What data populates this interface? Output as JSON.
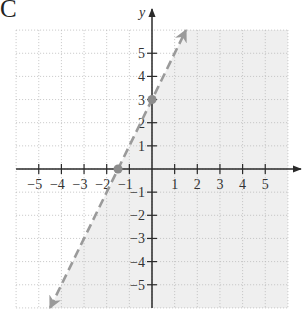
{
  "panel_label": "C",
  "colors": {
    "shading": "#efefef",
    "grid": "#b8b8b8",
    "axis": "#2a2a2a",
    "boundary_line": "#9a9a9a",
    "points": "#8c8c8c",
    "text": "#333333"
  },
  "chart_data": {
    "type": "line",
    "title": "",
    "subtitle": "",
    "panel": "C",
    "xlabel": "",
    "ylabel": "y",
    "xlim": [
      -6,
      6
    ],
    "ylim": [
      -6,
      6
    ],
    "grid": true,
    "grid_style": "dotted",
    "legend": null,
    "x_ticks": [
      -5,
      -4,
      -3,
      -2,
      -1,
      1,
      2,
      3,
      4,
      5
    ],
    "y_ticks": [
      -5,
      -4,
      -3,
      -2,
      -1,
      1,
      2,
      3,
      4,
      5
    ],
    "x_tick_labels": [
      "−5",
      "−4",
      "−3",
      "−2",
      "−1",
      "1",
      "2",
      "3",
      "4",
      "5"
    ],
    "y_tick_labels": [
      "−5",
      "−4",
      "−3",
      "−2",
      "−1",
      "1",
      "2",
      "3",
      "4",
      "5"
    ],
    "series": [
      {
        "name": "boundary y = 2x + 3",
        "style": "dashed",
        "arrows": "both",
        "slope": 2,
        "intercept": 3,
        "x": [
          -4.5,
          1.5
        ],
        "y": [
          -6,
          6
        ]
      }
    ],
    "points": [
      {
        "x": 0,
        "y": 3,
        "label": "y-intercept"
      },
      {
        "x": -1.5,
        "y": 0,
        "label": "x-intercept"
      }
    ],
    "shaded_region": {
      "inequality": "y < 2x + 3",
      "side": "right/below of boundary line",
      "boundary_included": false
    },
    "annotations": []
  }
}
